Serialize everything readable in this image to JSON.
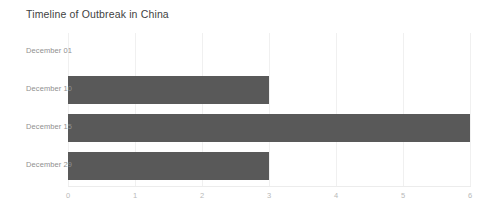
{
  "chart_data": {
    "type": "bar",
    "orientation": "horizontal",
    "title": "Timeline of Outbreak in China",
    "categories": [
      "December 01",
      "December 10",
      "December 15",
      "December 29"
    ],
    "values": [
      0,
      3,
      6,
      3
    ],
    "xlabel": "",
    "ylabel": "",
    "xlim": [
      0,
      6
    ],
    "xticks": [
      "0",
      "1",
      "2",
      "3",
      "4",
      "5",
      "6"
    ],
    "grid": true,
    "legend": false,
    "bar_color": "#595959",
    "background_color": "#ffffff",
    "title_color": "#3f3f3f",
    "label_color": "#909090",
    "tick_color": "#b9b9b9",
    "gridline_color": "#f0f0f0"
  }
}
